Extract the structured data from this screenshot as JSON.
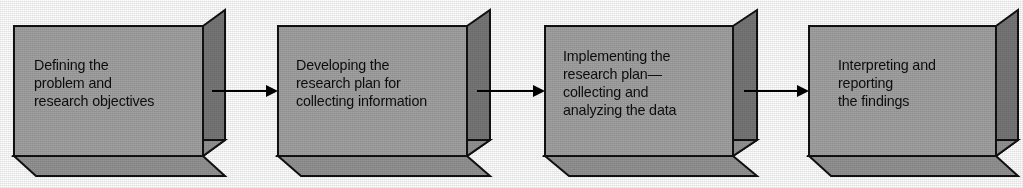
{
  "diagram": {
    "type": "linear-process-flow",
    "orientation": "left-to-right",
    "step_count": 4,
    "colors": {
      "box_front": "#a3a3a3",
      "box_side": "#787878",
      "box_bottom": "#949494",
      "outline": "#111111",
      "arrow": "#000000",
      "text": "#0d0d0d",
      "background": "#ffffff"
    },
    "steps": [
      {
        "index": 1,
        "name": "defining-the-problem",
        "lines": [
          "Defining the",
          "problem and",
          "research objectives"
        ]
      },
      {
        "index": 2,
        "name": "developing-the-research-plan",
        "lines": [
          "Developing the",
          "research plan for",
          "collecting information"
        ]
      },
      {
        "index": 3,
        "name": "implementing-the-research-plan",
        "lines": [
          "Implementing the",
          "research plan—",
          "collecting and",
          "analyzing the data"
        ]
      },
      {
        "index": 4,
        "name": "interpreting-and-reporting",
        "lines": [
          "Interpreting and",
          "reporting",
          "the findings"
        ]
      }
    ],
    "connectors": [
      {
        "name": "arrow-step1-to-step2",
        "from": 1,
        "to": 2,
        "glyph": "arrow-right-icon"
      },
      {
        "name": "arrow-step2-to-step3",
        "from": 2,
        "to": 3,
        "glyph": "arrow-right-icon"
      },
      {
        "name": "arrow-step3-to-step4",
        "from": 3,
        "to": 4,
        "glyph": "arrow-right-icon"
      }
    ]
  }
}
